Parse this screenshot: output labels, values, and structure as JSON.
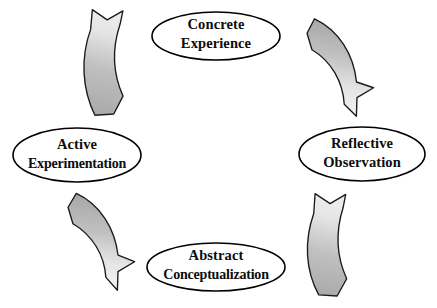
{
  "diagram": {
    "type": "cyclic-process",
    "background_color": "#ffffff",
    "stroke_color": "#000000",
    "text_color": "#0d0d0d",
    "arrow_dark_color": "#aaaaaa",
    "arrow_light_color": "#ededed",
    "nodes": [
      {
        "id": "concrete-experience",
        "position": "top",
        "line1": "Concrete",
        "line2": "Experience",
        "cx": 216,
        "cy": 36,
        "rx": 64,
        "ry": 24
      },
      {
        "id": "reflective-observation",
        "position": "right",
        "line1": "Reflective",
        "line2": "Observation",
        "cx": 362,
        "cy": 154,
        "rx": 63,
        "ry": 27
      },
      {
        "id": "abstract-conceptualization",
        "position": "bottom",
        "line1": "Abstract",
        "line2": "Conceptualization",
        "cx": 216,
        "cy": 267,
        "rx": 69,
        "ry": 24
      },
      {
        "id": "active-experimentation",
        "position": "left",
        "line1": "Active",
        "line2": "Experimentation",
        "cx": 77,
        "cy": 155,
        "rx": 64,
        "ry": 27
      }
    ],
    "arrows": [
      {
        "id": "arrow-active-to-concrete",
        "from": "active-experimentation",
        "to": "concrete-experience",
        "quadrant": "top-left",
        "direction": "clockwise"
      },
      {
        "id": "arrow-concrete-to-reflective",
        "from": "concrete-experience",
        "to": "reflective-observation",
        "quadrant": "top-right",
        "direction": "clockwise"
      },
      {
        "id": "arrow-reflective-to-abstract",
        "from": "reflective-observation",
        "to": "abstract-conceptualization",
        "quadrant": "bottom-right",
        "direction": "clockwise"
      },
      {
        "id": "arrow-abstract-to-active",
        "from": "abstract-conceptualization",
        "to": "active-experimentation",
        "quadrant": "bottom-left",
        "direction": "clockwise"
      }
    ]
  }
}
